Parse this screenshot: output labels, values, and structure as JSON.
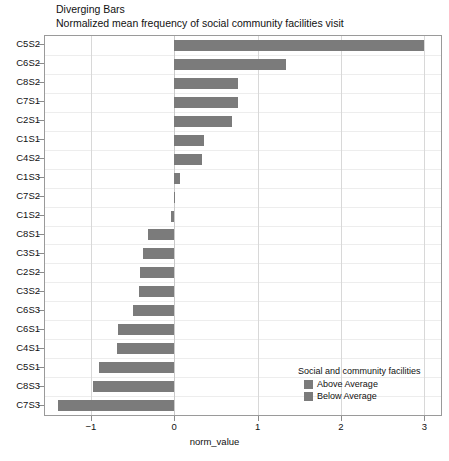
{
  "chart_data": {
    "type": "bar",
    "orientation": "horizontal",
    "title": "Diverging Bars",
    "subtitle": "Normalized mean frequency of social community facilities visit",
    "xlabel": "norm_value",
    "ylabel": "",
    "categories": [
      "C5S2",
      "C6S2",
      "C8S2",
      "C7S1",
      "C2S1",
      "C1S1",
      "C4S2",
      "C1S3",
      "C7S2",
      "C1S2",
      "C8S1",
      "C3S1",
      "C2S2",
      "C3S2",
      "C6S3",
      "C6S1",
      "C4S1",
      "C5S1",
      "C8S3",
      "C7S3"
    ],
    "values": [
      3.0,
      1.34,
      0.77,
      0.76,
      0.69,
      0.36,
      0.33,
      0.07,
      0.01,
      -0.04,
      -0.31,
      -0.38,
      -0.41,
      -0.42,
      -0.49,
      -0.67,
      -0.69,
      -0.9,
      -0.98,
      -1.39
    ],
    "xlim": [
      -1.55,
      3.2
    ],
    "xticks": [
      -1,
      0,
      1,
      2,
      3
    ],
    "xticklabels": [
      "−1",
      "0",
      "1",
      "2",
      "3"
    ],
    "grid": true,
    "bar_color": "#7b7b7b",
    "legend": {
      "position": "bottom-right",
      "title": "Social and community facilities",
      "entries": [
        {
          "label": "Above Average",
          "color": "#7b7b7b"
        },
        {
          "label": "Below Average",
          "color": "#7b7b7b"
        }
      ]
    }
  }
}
